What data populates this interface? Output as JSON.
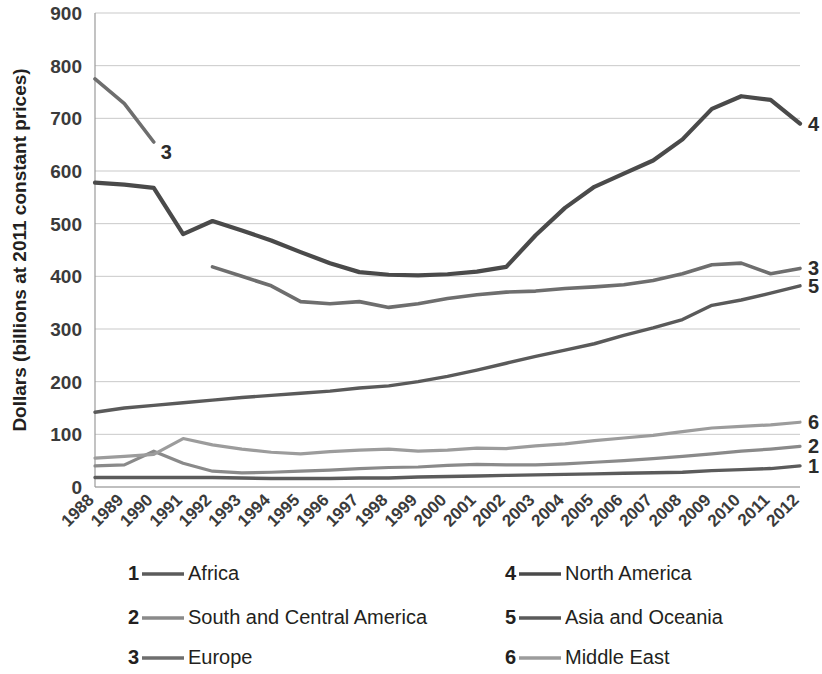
{
  "chart_data": {
    "type": "line",
    "title": "",
    "xlabel": "",
    "ylabel": "Dollars (billions at 2011 constant prices)",
    "ylim": [
      0,
      900
    ],
    "ytick_values": [
      0,
      100,
      200,
      300,
      400,
      500,
      600,
      700,
      800,
      900
    ],
    "ytick_labels": [
      "0",
      "100",
      "200",
      "300",
      "400",
      "500",
      "600",
      "700",
      "800",
      "900"
    ],
    "grid": true,
    "legend_position": "bottom",
    "x": [
      1988,
      1989,
      1990,
      1991,
      1992,
      1993,
      1994,
      1995,
      1996,
      1997,
      1998,
      1999,
      2000,
      2001,
      2002,
      2003,
      2004,
      2005,
      2006,
      2007,
      2008,
      2009,
      2010,
      2011,
      2012
    ],
    "xtick_labels": [
      "1988",
      "1989",
      "1990",
      "1991",
      "1992",
      "1993",
      "1994",
      "1995",
      "1996",
      "1997",
      "1998",
      "1999",
      "2000",
      "2001",
      "2002",
      "2003",
      "2004",
      "2005",
      "2006",
      "2007",
      "2008",
      "2009",
      "2010",
      "2011",
      "2012"
    ],
    "series": [
      {
        "key": "1",
        "name": "Africa",
        "color": "#5b5b5b",
        "width": 3.4,
        "end_label": "1",
        "values": [
          18,
          18,
          18,
          18,
          18,
          17,
          16,
          16,
          16,
          17,
          17,
          19,
          20,
          21,
          22,
          23,
          24,
          25,
          26,
          27,
          28,
          31,
          33,
          35,
          40
        ]
      },
      {
        "key": "2",
        "name": "South and Central America",
        "color": "#8a8a8a",
        "width": 3.2,
        "end_label": "2",
        "values": [
          40,
          42,
          68,
          45,
          30,
          27,
          28,
          30,
          32,
          35,
          37,
          38,
          41,
          43,
          42,
          42,
          44,
          47,
          50,
          54,
          58,
          63,
          68,
          72,
          77
        ]
      },
      {
        "key": "3",
        "name": "Europe",
        "color": "#6e6e6e",
        "width": 3.6,
        "end_label": "3",
        "values": [
          775,
          728,
          655,
          null,
          418,
          400,
          382,
          352,
          348,
          352,
          341,
          348,
          358,
          365,
          370,
          372,
          377,
          380,
          384,
          392,
          405,
          422,
          425,
          405,
          415
        ]
      },
      {
        "key": "4",
        "name": "North America",
        "color": "#4a4a4a",
        "width": 4.2,
        "end_label": "4",
        "values": [
          578,
          574,
          568,
          480,
          505,
          487,
          468,
          446,
          425,
          408,
          403,
          402,
          404,
          409,
          418,
          478,
          530,
          570,
          595,
          620,
          660,
          718,
          742,
          735,
          690
        ]
      },
      {
        "key": "5",
        "name": "Asia and Oceania",
        "color": "#5a5a5a",
        "width": 3.4,
        "end_label": "5",
        "values": [
          142,
          150,
          155,
          160,
          165,
          170,
          174,
          178,
          182,
          188,
          192,
          200,
          210,
          222,
          235,
          248,
          260,
          272,
          288,
          302,
          318,
          345,
          355,
          368,
          382
        ]
      },
      {
        "key": "6",
        "name": "Middle East",
        "color": "#9c9c9c",
        "width": 3.2,
        "end_label": "6",
        "values": [
          55,
          58,
          62,
          92,
          80,
          72,
          66,
          63,
          67,
          70,
          72,
          68,
          70,
          74,
          73,
          78,
          82,
          88,
          93,
          98,
          105,
          112,
          115,
          118,
          123
        ]
      }
    ],
    "legend": [
      {
        "key": "1",
        "label": "Africa",
        "color": "#5b5b5b"
      },
      {
        "key": "2",
        "label": "South and Central America",
        "color": "#8a8a8a"
      },
      {
        "key": "3",
        "label": "Europe",
        "color": "#6e6e6e"
      },
      {
        "key": "4",
        "label": "North America",
        "color": "#4a4a4a"
      },
      {
        "key": "5",
        "label": "Asia and Oceania",
        "color": "#5a5a5a"
      },
      {
        "key": "6",
        "label": "Middle East",
        "color": "#9c9c9c"
      }
    ],
    "end_labels": [
      {
        "key": "4",
        "value": 690
      },
      {
        "key": "3",
        "value": 415
      },
      {
        "key": "5",
        "value": 382
      },
      {
        "key": "6",
        "value": 123
      },
      {
        "key": "2",
        "value": 77
      },
      {
        "key": "1",
        "value": 40
      }
    ],
    "inline_annotations": [
      {
        "key": "3",
        "text": "3",
        "at_x": 1990,
        "value": 655
      }
    ]
  }
}
